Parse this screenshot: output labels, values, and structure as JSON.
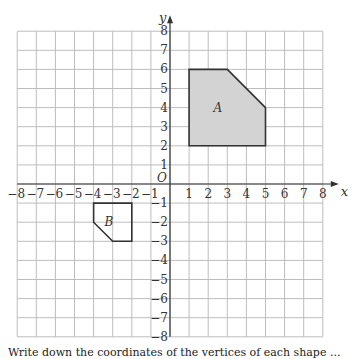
{
  "chart_data": {
    "type": "coordinate-grid",
    "xlabel": "x",
    "ylabel": "y",
    "origin_label": "O",
    "xlim": [
      -8,
      8
    ],
    "ylim": [
      -8,
      8
    ],
    "x_ticks": [
      "-8",
      "-7",
      "-6",
      "-5",
      "-4",
      "-3",
      "-2",
      "-1",
      "1",
      "2",
      "3",
      "4",
      "5",
      "6",
      "7",
      "8"
    ],
    "y_ticks": [
      "8",
      "7",
      "6",
      "5",
      "4",
      "3",
      "2",
      "1",
      "-1",
      "-2",
      "-3",
      "-4",
      "-5",
      "-6",
      "-7",
      "-8"
    ],
    "grid": true,
    "shapes": [
      {
        "name": "A",
        "label": "A",
        "fill": "#d3d3d3",
        "vertices": [
          [
            1,
            2
          ],
          [
            1,
            6
          ],
          [
            3,
            6
          ],
          [
            5,
            4
          ],
          [
            5,
            2
          ]
        ],
        "label_pos": [
          2.5,
          4
        ]
      },
      {
        "name": "B",
        "label": "B",
        "fill": "none",
        "vertices": [
          [
            -4,
            -1
          ],
          [
            -2,
            -1
          ],
          [
            -2,
            -3
          ],
          [
            -3,
            -3
          ],
          [
            -4,
            -2
          ]
        ],
        "label_pos": [
          -3.2,
          -2
        ]
      }
    ]
  },
  "caption": "Write down the coordinates of the vertices of each shape ..."
}
